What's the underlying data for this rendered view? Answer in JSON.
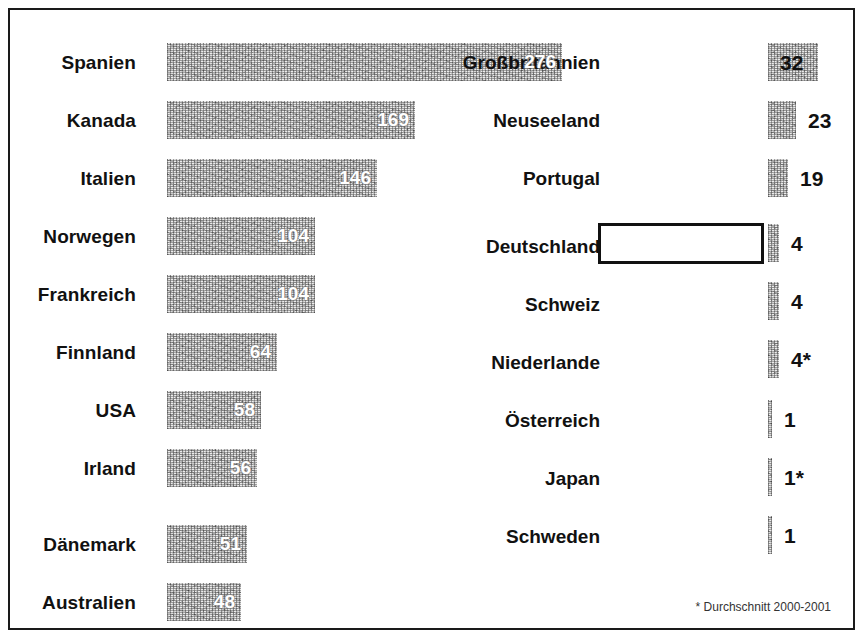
{
  "chart_data": {
    "type": "bar",
    "title": "",
    "xlabel": "",
    "ylabel": "",
    "orientation": "horizontal",
    "grid": false,
    "legend": "none",
    "xlim": [
      0,
      276
    ],
    "footnote": "* Durchschnitt 2000-2001",
    "highlighted_category": "Deutschland",
    "categories": [
      "Spanien",
      "Kanada",
      "Italien",
      "Norwegen",
      "Frankreich",
      "Finnland",
      "USA",
      "Irland",
      "Dänemark",
      "Australien",
      "Großbritannien",
      "Neuseeland",
      "Portugal",
      "Deutschland",
      "Schweiz",
      "Niederlande",
      "Österreich",
      "Japan",
      "Schweden"
    ],
    "values": [
      276,
      169,
      146,
      104,
      104,
      64,
      58,
      56,
      51,
      48,
      32,
      23,
      19,
      4,
      4,
      4,
      1,
      1,
      1
    ],
    "value_labels": [
      "276",
      "169",
      "146",
      "104",
      "104",
      "64",
      "58",
      "56",
      "51",
      "48",
      "32",
      "23",
      "19",
      "4",
      "4",
      "4*",
      "1",
      "1*",
      "1"
    ]
  },
  "left_column": {
    "rows": [
      {
        "label": "Spanien",
        "value": "276",
        "bar_width": 395,
        "top": 33,
        "label_top": 38
      },
      {
        "label": "Kanada",
        "value": "169",
        "bar_width": 248,
        "top": 91,
        "label_top": 96
      },
      {
        "label": "Italien",
        "value": "146",
        "bar_width": 210,
        "top": 149,
        "label_top": 154
      },
      {
        "label": "Norwegen",
        "value": "104",
        "bar_width": 148,
        "top": 207,
        "label_top": 212
      },
      {
        "label": "Frankreich",
        "value": "104",
        "bar_width": 148,
        "top": 265,
        "label_top": 270
      },
      {
        "label": "Finnland",
        "value": "64",
        "bar_width": 110,
        "top": 323,
        "label_top": 328
      },
      {
        "label": "USA",
        "value": "58",
        "bar_width": 94,
        "top": 381,
        "label_top": 386
      },
      {
        "label": "Irland",
        "value": "56",
        "bar_width": 90,
        "top": 439,
        "label_top": 444
      },
      {
        "label": "Dänemark",
        "value": "51",
        "bar_width": 80,
        "top": 515,
        "label_top": 520
      },
      {
        "label": "Australien",
        "value": "48",
        "bar_width": 74,
        "top": 573,
        "label_top": 578
      }
    ]
  },
  "right_column": {
    "rows": [
      {
        "label": "Großbritannien",
        "value": "32",
        "bar_width": 50,
        "top": 33,
        "label_top": 38,
        "value_inside": true,
        "highlighted": false
      },
      {
        "label": "Neuseeland",
        "value": "23",
        "bar_width": 28,
        "top": 91,
        "label_top": 96,
        "value_inside": false,
        "highlighted": false
      },
      {
        "label": "Portugal",
        "value": "19",
        "bar_width": 20,
        "top": 149,
        "label_top": 154,
        "value_inside": false,
        "highlighted": false
      },
      {
        "label": "Deutschland",
        "value": "4",
        "bar_width": 11,
        "top": 214,
        "label_top": 222,
        "value_inside": false,
        "highlighted": true
      },
      {
        "label": "Schweiz",
        "value": "4",
        "bar_width": 11,
        "top": 272,
        "label_top": 280,
        "value_inside": false,
        "highlighted": false
      },
      {
        "label": "Niederlande",
        "value": "4*",
        "bar_width": 11,
        "top": 330,
        "label_top": 338,
        "value_inside": false,
        "highlighted": false
      },
      {
        "label": "Österreich",
        "value": "1",
        "bar_width": 4,
        "top": 390,
        "label_top": 396,
        "value_inside": false,
        "highlighted": false
      },
      {
        "label": "Japan",
        "value": "1*",
        "bar_width": 4,
        "top": 448,
        "label_top": 454,
        "value_inside": false,
        "highlighted": false
      },
      {
        "label": "Schweden",
        "value": "1",
        "bar_width": 4,
        "top": 506,
        "label_top": 512,
        "value_inside": false,
        "highlighted": false
      }
    ]
  },
  "footnote": {
    "text": "* Durchschnitt 2000-2001"
  }
}
